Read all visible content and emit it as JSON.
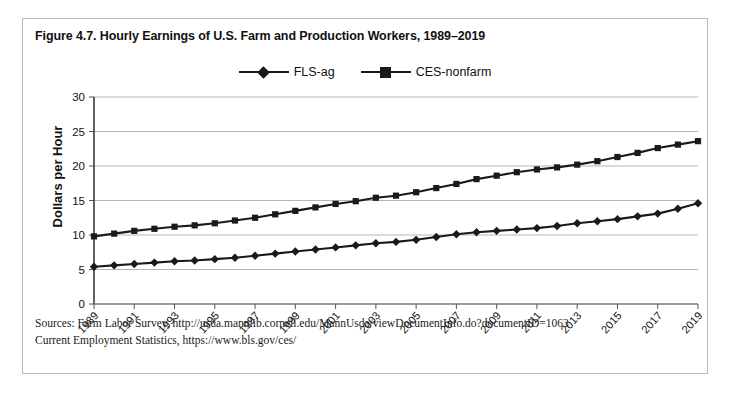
{
  "figure": {
    "title": "Figure 4.7. Hourly Earnings of U.S. Farm and Production Workers, 1989–2019",
    "ylabel": "Dollars per Hour",
    "sources": [
      "Sources: Farm Labor Survey, http://usda.mannlib.cornell.edu/MannUsda/viewDocumentInfo.do?documentID=1063",
      "Current Employment Statistics, https://www.bls.gov/ces/"
    ]
  },
  "legend": {
    "entries": [
      {
        "label": "FLS-ag",
        "marker": "diamond",
        "color": "#1a1a1a"
      },
      {
        "label": "CES-nonfarm",
        "marker": "square",
        "color": "#1a1a1a"
      }
    ]
  },
  "chart_data": {
    "type": "line",
    "title": "Figure 4.7. Hourly Earnings of U.S. Farm and Production Workers, 1989–2019",
    "xlabel": "",
    "ylabel": "Dollars per Hour",
    "ylim": [
      0,
      30
    ],
    "yticks": [
      0,
      5,
      10,
      15,
      20,
      25,
      30
    ],
    "grid": "horizontal",
    "legend_position": "top-center",
    "x": [
      1989,
      1990,
      1991,
      1992,
      1993,
      1994,
      1995,
      1996,
      1997,
      1998,
      1999,
      2000,
      2001,
      2002,
      2003,
      2004,
      2005,
      2006,
      2007,
      2008,
      2009,
      2010,
      2011,
      2012,
      2013,
      2014,
      2015,
      2016,
      2017,
      2018,
      2019
    ],
    "xtick_labels": [
      1989,
      1991,
      1993,
      1995,
      1997,
      1999,
      2001,
      2003,
      2005,
      2007,
      2009,
      2011,
      2013,
      2015,
      2017,
      2019
    ],
    "series": [
      {
        "name": "FLS-ag",
        "marker": "diamond",
        "color": "#1a1a1a",
        "values": [
          5.4,
          5.6,
          5.8,
          6.0,
          6.2,
          6.3,
          6.5,
          6.7,
          7.0,
          7.3,
          7.6,
          7.9,
          8.2,
          8.5,
          8.8,
          9.0,
          9.3,
          9.7,
          10.1,
          10.4,
          10.6,
          10.8,
          11.0,
          11.3,
          11.7,
          12.0,
          12.3,
          12.7,
          13.1,
          13.8,
          14.6
        ]
      },
      {
        "name": "CES-nonfarm",
        "marker": "square",
        "color": "#1a1a1a",
        "values": [
          9.8,
          10.2,
          10.6,
          10.9,
          11.2,
          11.4,
          11.7,
          12.1,
          12.5,
          13.0,
          13.5,
          14.0,
          14.5,
          14.9,
          15.4,
          15.7,
          16.2,
          16.8,
          17.4,
          18.1,
          18.6,
          19.1,
          19.5,
          19.8,
          20.2,
          20.7,
          21.3,
          21.9,
          22.6,
          23.1,
          23.6
        ]
      }
    ]
  }
}
